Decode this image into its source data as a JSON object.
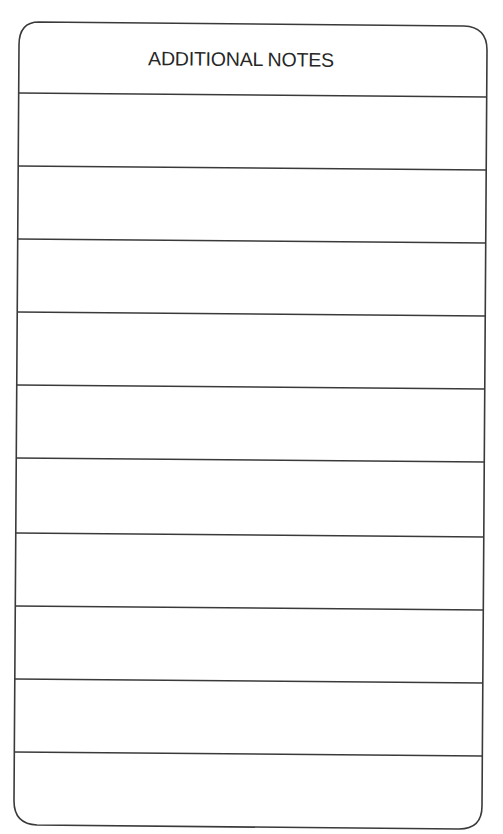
{
  "notes_card": {
    "title": "ADDITIONAL NOTES",
    "line_color": "#3a3a3a",
    "rows": [
      {
        "text": ""
      },
      {
        "text": ""
      },
      {
        "text": ""
      },
      {
        "text": ""
      },
      {
        "text": ""
      },
      {
        "text": ""
      },
      {
        "text": ""
      },
      {
        "text": ""
      },
      {
        "text": ""
      },
      {
        "text": ""
      }
    ]
  }
}
